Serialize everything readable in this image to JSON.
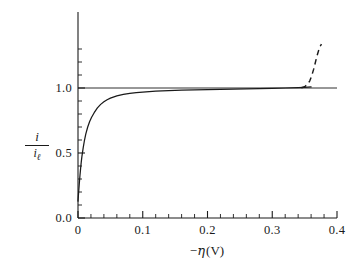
{
  "figure": {
    "background_color": "#ffffff",
    "line_color": "#1a1a1a"
  },
  "axes": {
    "x_title_prefix": "−",
    "x_title_symbol": "η",
    "x_title_units": "(V)",
    "x_title_full": "−η (V)",
    "y_title_numerator": "i",
    "y_title_denominator": "i",
    "y_title_denominator_sub": "ℓ",
    "y_title_full": "i / iℓ",
    "x_tick_labels": [
      "0",
      "0.1",
      "0.2",
      "0.3",
      "0.4"
    ],
    "y_tick_labels": [
      "0.0",
      "0.5",
      "1.0"
    ]
  },
  "chart_data": {
    "type": "line",
    "title": "",
    "xlabel": "−η (V)",
    "ylabel": "i / iℓ",
    "xlim": [
      0,
      0.4
    ],
    "ylim": [
      0,
      1.45
    ],
    "grid": false,
    "legend": "none",
    "x_ticks": [
      0,
      0.1,
      0.2,
      0.3,
      0.4
    ],
    "y_ticks": [
      0.0,
      0.5,
      1.0
    ],
    "x_minor_tick_step": 0.02,
    "y_minor_tick_step": 0.1,
    "series": [
      {
        "name": "polarization-curve-solid",
        "style": "solid",
        "x": [
          0.0,
          0.001,
          0.002,
          0.003,
          0.004,
          0.005,
          0.006,
          0.008,
          0.01,
          0.012,
          0.015,
          0.018,
          0.021,
          0.025,
          0.03,
          0.035,
          0.04,
          0.045,
          0.05,
          0.06,
          0.07,
          0.08,
          0.09,
          0.1,
          0.12,
          0.14,
          0.16,
          0.18,
          0.2,
          0.22,
          0.24,
          0.26,
          0.28,
          0.3,
          0.32,
          0.34,
          0.35,
          0.36
        ],
        "y": [
          0.13,
          0.2,
          0.265,
          0.325,
          0.38,
          0.43,
          0.472,
          0.54,
          0.598,
          0.645,
          0.7,
          0.742,
          0.775,
          0.81,
          0.847,
          0.874,
          0.894,
          0.91,
          0.922,
          0.94,
          0.951,
          0.959,
          0.965,
          0.969,
          0.976,
          0.98,
          0.983,
          0.986,
          0.988,
          0.99,
          0.992,
          0.994,
          0.996,
          0.998,
          1.0,
          1.003,
          1.005,
          1.008
        ]
      },
      {
        "name": "polarization-curve-dashed",
        "style": "dashed",
        "x": [
          0.345,
          0.35,
          0.355,
          0.358,
          0.361,
          0.364,
          0.366,
          0.368,
          0.37,
          0.372,
          0.374,
          0.376
        ],
        "y": [
          1.002,
          1.01,
          1.03,
          1.055,
          1.095,
          1.145,
          1.185,
          1.225,
          1.262,
          1.295,
          1.32,
          1.338
        ]
      },
      {
        "name": "limiting-current-asymptote",
        "style": "solid-horizontal",
        "x": [
          0.0,
          0.4
        ],
        "y": [
          1.0,
          1.0
        ]
      }
    ]
  }
}
